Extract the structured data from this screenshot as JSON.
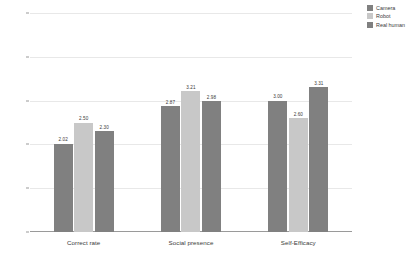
{
  "chart_data": {
    "type": "bar",
    "title": "",
    "subtitle": "",
    "xlabel": "",
    "ylabel": "",
    "categories": [
      "Correct rate",
      "Social presence",
      "Self-Efficacy"
    ],
    "series": [
      {
        "name": "Camera",
        "color": "#808080",
        "values": [
          2.02,
          2.87,
          3.0
        ],
        "labels": [
          "2.02",
          "2.87",
          "3.00"
        ]
      },
      {
        "name": "Robot",
        "color": "#c8c8c8",
        "values": [
          2.5,
          3.21,
          2.6
        ],
        "labels": [
          "2.50",
          "3.21",
          "2.60"
        ]
      },
      {
        "name": "Real human",
        "color": "#808080",
        "values": [
          2.3,
          2.98,
          3.31
        ],
        "labels": [
          "2.30",
          "2.98",
          "3.31"
        ]
      }
    ],
    "ylim": [
      0,
      5
    ],
    "ytick_values": [
      0,
      1,
      2,
      3,
      4,
      5
    ],
    "ytick_labels": [
      "0.00",
      "1.00",
      "2.00",
      "3.00",
      "4.00",
      "5.00"
    ],
    "grid": true,
    "grid_axis": "y",
    "legend_position": "right-top",
    "background": "#ffffff",
    "axis_color": "#9a9a9a",
    "grid_color": "#e8e8e8"
  },
  "legend": {
    "items": [
      {
        "label": "Camera",
        "color": "#808080"
      },
      {
        "label": "Robot",
        "color": "#c8c8c8"
      },
      {
        "label": "Real human",
        "color": "#808080"
      }
    ]
  }
}
